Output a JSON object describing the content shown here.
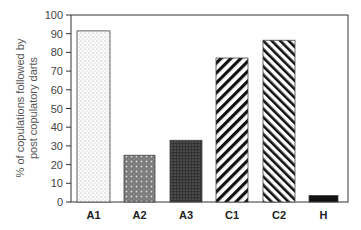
{
  "chart_data": {
    "type": "bar",
    "title": "",
    "xlabel": "",
    "ylabel": "% of copulations followed by post copulatory darts",
    "ylabel_lines": [
      "% of copulations followed by",
      "post copulatory darts"
    ],
    "ylim": [
      0,
      100
    ],
    "yticks": [
      0,
      10,
      20,
      30,
      40,
      50,
      60,
      70,
      80,
      90,
      100
    ],
    "grid": false,
    "legend": null,
    "categories": [
      "A1",
      "A2",
      "A3",
      "C1",
      "C2",
      "H"
    ],
    "values": [
      91.5,
      25,
      33,
      77,
      86.5,
      3.5
    ],
    "patterns": [
      "fine-dots",
      "crosshatch-dots-medium",
      "crosshatch-dots-dark",
      "diagonal-stripes-wide",
      "diagonal-stripes-narrow",
      "solid-black"
    ]
  }
}
